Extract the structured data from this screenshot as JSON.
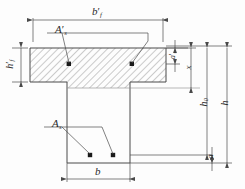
{
  "figure": {
    "colors": {
      "line": "#4a4a4a",
      "hatch": "#6b6b6b",
      "rebar": "#1a1a1a",
      "background": "#fdfdfd"
    }
  },
  "labels": {
    "flange_width": {
      "base": "b",
      "sub": "f",
      "prime": "′"
    },
    "flange_depth": {
      "base": "h",
      "sub": "f",
      "prime": "′"
    },
    "web_width": {
      "base": "b",
      "sub": "",
      "prime": ""
    },
    "compression_zone_depth": {
      "base": "x",
      "sub": "",
      "prime": ""
    },
    "top_steel_area": {
      "base": "A",
      "sub": "s",
      "prime": "′"
    },
    "bottom_steel_area": {
      "base": "A",
      "sub": "s",
      "prime": ""
    },
    "top_cover": {
      "base": "a",
      "sub": "s",
      "prime": "′"
    },
    "effective_depth": {
      "base": "h",
      "sub": "0",
      "prime": ""
    },
    "total_depth": {
      "base": "h",
      "sub": "",
      "prime": ""
    },
    "bottom_cover": {
      "base": "a",
      "sub": "",
      "prime": ""
    }
  },
  "label_text": {
    "flange_width": "b′f",
    "flange_depth": "h′f",
    "web_width": "b",
    "compression_zone_depth": "x",
    "top_steel_area": "A′s",
    "bottom_steel_area": "As",
    "top_cover": "a′s",
    "effective_depth": "h0",
    "total_depth": "h",
    "bottom_cover": "a"
  },
  "geometry": {
    "flange_left": 30,
    "flange_right": 166,
    "flange_top": 48,
    "flange_bottom": 82,
    "web_left": 67,
    "web_right": 130,
    "web_bottom": 163,
    "neutral_axis_y": 88
  },
  "rebars": {
    "top": [
      {
        "x": 69,
        "y": 64
      },
      {
        "x": 132,
        "y": 64
      }
    ],
    "bottom": [
      {
        "x": 90,
        "y": 155
      },
      {
        "x": 113,
        "y": 155
      }
    ]
  }
}
